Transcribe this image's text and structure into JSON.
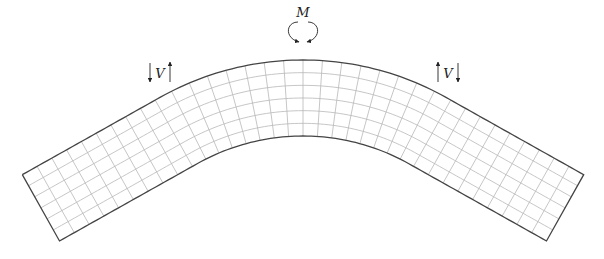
{
  "figure": {
    "labels": {
      "moment": "M",
      "shear_left": "V",
      "shear_right": "V"
    },
    "colors": {
      "outline": "#444444",
      "grid": "#b8b8b8",
      "arrow": "#222222",
      "background": "#ffffff"
    },
    "beam": {
      "center_x": 303,
      "centerline_top_y": 98,
      "thickness": 76,
      "arc_radius": 254,
      "arc_half_angle_deg": 29.3,
      "straight_length": 158,
      "columns": 34,
      "rows": 6
    },
    "annotations": {
      "moment": {
        "x": 303,
        "y": 14
      },
      "shear_left": {
        "x": 160,
        "y": 77,
        "down_arrow_x": 150,
        "up_arrow_x": 170
      },
      "shear_right": {
        "x": 448,
        "y": 77,
        "up_arrow_x": 438,
        "down_arrow_x": 458
      }
    }
  }
}
